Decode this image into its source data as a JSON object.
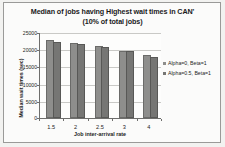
{
  "chart_data": {
    "type": "bar",
    "title": "Median of jobs having Highest wait times in CAN'",
    "subtitle": "(10% of total jobs)",
    "xlabel": "Job inter-arrival rate",
    "ylabel": "Median wait times (sec)",
    "categories": [
      "1.5",
      "2",
      "2.5",
      "3",
      "4"
    ],
    "series": [
      {
        "name": "Alpha=0, Beta=1",
        "color": "#8e8e8c",
        "values": [
          22000,
          21200,
          20300,
          18900,
          17600
        ]
      },
      {
        "name": "Alpha=0.5, Beta=1",
        "color": "#767674",
        "values": [
          21500,
          20800,
          20000,
          18900,
          17300
        ]
      }
    ],
    "ylim": [
      0,
      25000
    ],
    "yticks": [
      0,
      5000,
      10000,
      15000,
      20000,
      25000
    ],
    "ytick_labels": [
      "0",
      "5000",
      "10000",
      "15000",
      "20000",
      "25000"
    ],
    "grid": true,
    "legend_position": "right"
  }
}
